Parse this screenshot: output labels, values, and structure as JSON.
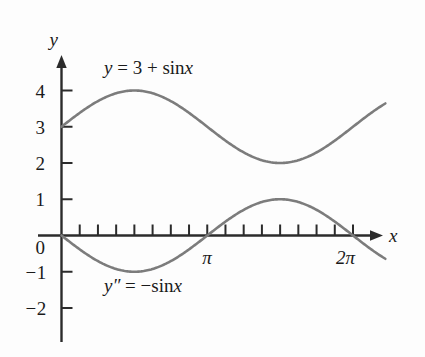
{
  "figure": {
    "axis_color": "#2b2b2b",
    "curve_color": "#7c7c7c",
    "background": "#fdfdfd",
    "x_axis_label": "x",
    "y_axis_label": "y"
  },
  "labels": {
    "upper_curve": "y = 3 + sin x",
    "lower_curve": "y″ = −sin x",
    "upper_curve_parts": {
      "lhs": "y",
      "eq": " = 3 + ",
      "fn": "sin",
      "arg": "x"
    },
    "lower_curve_parts": {
      "lhs": "y″",
      "eq": " = −",
      "fn": "sin",
      "arg": "x"
    }
  },
  "y_ticks": [
    {
      "label": "4",
      "value": 4
    },
    {
      "label": "3",
      "value": 3
    },
    {
      "label": "2",
      "value": 2
    },
    {
      "label": "1",
      "value": 1
    },
    {
      "label": "0",
      "value": 0
    },
    {
      "label": "−1",
      "value": -1
    },
    {
      "label": "−2",
      "value": -2
    }
  ],
  "x_ticks": [
    {
      "label": "",
      "value": 0.3927
    },
    {
      "label": "",
      "value": 0.7854
    },
    {
      "label": "",
      "value": 1.1781
    },
    {
      "label": "",
      "value": 1.5708
    },
    {
      "label": "",
      "value": 1.9635
    },
    {
      "label": "",
      "value": 2.3562
    },
    {
      "label": "",
      "value": 2.7489
    },
    {
      "label": "π",
      "value": 3.1416
    },
    {
      "label": "",
      "value": 3.5343
    },
    {
      "label": "",
      "value": 3.927
    },
    {
      "label": "",
      "value": 4.3197
    },
    {
      "label": "",
      "value": 4.7124
    },
    {
      "label": "",
      "value": 5.1051
    },
    {
      "label": "",
      "value": 5.4978
    },
    {
      "label": "",
      "value": 5.8905
    },
    {
      "label": "2π",
      "value": 6.2832
    }
  ],
  "chart_data": {
    "type": "line",
    "title": "",
    "xlabel": "x",
    "ylabel": "y",
    "xlim": [
      0,
      6.98
    ],
    "ylim": [
      -2.45,
      4.85
    ],
    "grid": false,
    "legend": "inline-curve-labels",
    "x_tick_labels": [
      "π",
      "2π"
    ],
    "x_tick_values": [
      3.1416,
      6.2832
    ],
    "y_tick_labels": [
      "4",
      "3",
      "2",
      "1",
      "0",
      "−1",
      "−2"
    ],
    "y_tick_values": [
      4,
      3,
      2,
      1,
      0,
      -1,
      -2
    ],
    "series": [
      {
        "name": "y = 3 + sin x",
        "formula": "3 + sin(x)",
        "color": "#7c7c7c",
        "x_start": 0.0,
        "x_end": 6.98,
        "key_points": [
          {
            "x": 0,
            "y": 3
          },
          {
            "x": 1.5708,
            "y": 4
          },
          {
            "x": 3.1416,
            "y": 3
          },
          {
            "x": 4.7124,
            "y": 2
          },
          {
            "x": 6.2832,
            "y": 3
          },
          {
            "x": 6.98,
            "y": 3.64
          }
        ]
      },
      {
        "name": "y″ = −sin x",
        "formula": "-sin(x)",
        "color": "#7c7c7c",
        "x_start": 0.0,
        "x_end": 6.98,
        "key_points": [
          {
            "x": 0,
            "y": 0
          },
          {
            "x": 1.5708,
            "y": -1
          },
          {
            "x": 3.1416,
            "y": 0
          },
          {
            "x": 4.7124,
            "y": 1
          },
          {
            "x": 6.2832,
            "y": 0
          },
          {
            "x": 6.98,
            "y": -0.64
          }
        ]
      }
    ]
  }
}
